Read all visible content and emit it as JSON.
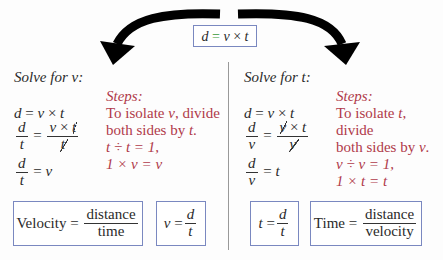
{
  "top_formula": {
    "d": "d",
    "eq": "=",
    "v": "v",
    "times": "×",
    "t": "t"
  },
  "left": {
    "heading": "Solve for v:",
    "lines": {
      "l1": {
        "d": "d",
        "eq": "=",
        "v": "v",
        "times": "×",
        "t": "t"
      },
      "l2": {
        "num": "d",
        "den": "t",
        "eq": "=",
        "rnum_v": "v",
        "rnum_times": "×",
        "rnum_t": "t",
        "rden": "t"
      },
      "l3": {
        "num": "d",
        "den": "t",
        "eq": "=",
        "rhs": "v"
      }
    },
    "steps": {
      "title": "Steps:",
      "line1_a": "To isolate ",
      "line1_var": "v",
      "line1_b": ", divide",
      "line2_a": "both sides by ",
      "line2_var": "t",
      "line2_b": ".",
      "line3": "t ÷ t = 1,",
      "line4": "1 × v = v"
    },
    "box1": {
      "label": "Velocity",
      "eq": "=",
      "num": "distance",
      "den": "time"
    },
    "box2": {
      "lhs": "v",
      "eq": "=",
      "num": "d",
      "den": "t"
    }
  },
  "right": {
    "heading": "Solve for t:",
    "lines": {
      "l1": {
        "d": "d",
        "eq": "=",
        "v": "v",
        "times": "×",
        "t": "t"
      },
      "l2": {
        "num": "d",
        "den": "v",
        "eq": "=",
        "rnum_v": "v",
        "rnum_times": "×",
        "rnum_t": "t",
        "rden": "v"
      },
      "l3": {
        "num": "d",
        "den": "v",
        "eq": "=",
        "rhs": "t"
      }
    },
    "steps": {
      "title": "Steps:",
      "line1_a": "To isolate ",
      "line1_var": "t",
      "line1_b": ", divide",
      "line2_a": "both sides by ",
      "line2_var": "v",
      "line2_b": ".",
      "line3": "v ÷ v = 1,",
      "line4": "1 × t = t"
    },
    "box1": {
      "lhs": "t",
      "eq": "=",
      "num": "d",
      "den": "t"
    },
    "box2": {
      "label": "Time",
      "eq": "=",
      "num": "distance",
      "den": "velocity"
    }
  },
  "colors": {
    "box_border": "#7a88c0",
    "steps": "#b03a4a",
    "equals": "#3a9a3a",
    "arrow": "#000000"
  }
}
